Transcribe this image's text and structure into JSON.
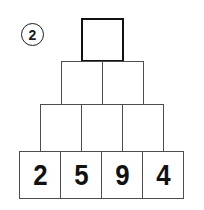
{
  "exercise": {
    "badge_label": "2",
    "badge_icon": "circled-number-icon"
  },
  "colors": {
    "background": "#ffffff",
    "brick_fill": "#ffffff",
    "brick_border": "#4d4d4d",
    "top_brick_border": "#111111",
    "digit_color": "#111111",
    "badge_border": "#1a1a1a"
  },
  "puzzle": {
    "type": "number-pyramid",
    "rows": [
      {
        "row_index": 1,
        "cell_count": 1,
        "values": [
          ""
        ]
      },
      {
        "row_index": 2,
        "cell_count": 2,
        "values": [
          "",
          ""
        ]
      },
      {
        "row_index": 3,
        "cell_count": 3,
        "values": [
          "",
          "",
          ""
        ]
      },
      {
        "row_index": 4,
        "cell_count": 4,
        "values": [
          "2",
          "5",
          "9",
          "4"
        ]
      }
    ]
  }
}
